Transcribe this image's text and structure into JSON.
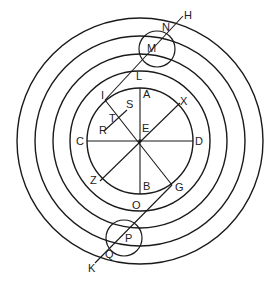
{
  "diagram": {
    "type": "geometry-concentric-circles",
    "colors": {
      "stroke": "#1a1a1a",
      "text": "#222222",
      "background": "#ffffff"
    },
    "center": {
      "x": 140,
      "y": 141
    },
    "rings": [
      {
        "name": "ring-1-inner",
        "r": 53
      },
      {
        "name": "ring-2",
        "r": 70
      },
      {
        "name": "ring-3",
        "r": 87
      },
      {
        "name": "ring-4",
        "r": 105
      },
      {
        "name": "ring-5-outer",
        "r": 123
      }
    ],
    "small_circles": [
      {
        "name": "circle-m",
        "cx": 157,
        "cy": 49,
        "r": 18
      },
      {
        "name": "circle-p",
        "cx": 124,
        "cy": 238,
        "r": 18
      }
    ],
    "segments": [
      {
        "name": "line-ab",
        "from": "A",
        "to": "B",
        "x1": 140,
        "y1": 88,
        "x2": 140,
        "y2": 194
      },
      {
        "name": "line-cd",
        "from": "C",
        "to": "D",
        "x1": 87,
        "y1": 141,
        "x2": 193,
        "y2": 141
      },
      {
        "name": "line-xz",
        "from": "X",
        "to": "Z",
        "x1": 180,
        "y1": 103,
        "x2": 100,
        "y2": 181
      },
      {
        "name": "line-ig",
        "from": "I",
        "to": "G",
        "x1": 105,
        "y1": 100,
        "x2": 172,
        "y2": 185
      },
      {
        "name": "line-rs",
        "from": "R",
        "to": "S",
        "x1": 104,
        "y1": 131,
        "x2": 127,
        "y2": 110
      },
      {
        "name": "line-lh",
        "from": "L",
        "to": "H",
        "x1": 105,
        "y1": 100,
        "x2": 183,
        "y2": 16
      },
      {
        "name": "line-gk",
        "from": "G",
        "to": "K",
        "x1": 172,
        "y1": 185,
        "x2": 95,
        "y2": 263
      }
    ],
    "labels": [
      {
        "text": "H",
        "x": 184,
        "y": 19
      },
      {
        "text": "N",
        "x": 162,
        "y": 31
      },
      {
        "text": "M",
        "x": 147,
        "y": 52
      },
      {
        "text": "L",
        "x": 136,
        "y": 80
      },
      {
        "text": "I",
        "x": 101,
        "y": 99
      },
      {
        "text": "S",
        "x": 126,
        "y": 108
      },
      {
        "text": "A",
        "x": 143,
        "y": 98
      },
      {
        "text": "X",
        "x": 180,
        "y": 105
      },
      {
        "text": "T",
        "x": 109,
        "y": 122
      },
      {
        "text": "R",
        "x": 99,
        "y": 134
      },
      {
        "text": "E",
        "x": 142,
        "y": 132
      },
      {
        "text": "C",
        "x": 76,
        "y": 145
      },
      {
        "text": "D",
        "x": 195,
        "y": 145
      },
      {
        "text": "Z",
        "x": 90,
        "y": 184
      },
      {
        "text": "B",
        "x": 143,
        "y": 190
      },
      {
        "text": "G",
        "x": 175,
        "y": 191
      },
      {
        "text": "O",
        "x": 132,
        "y": 209
      },
      {
        "text": "P",
        "x": 125,
        "y": 242
      },
      {
        "text": "Q",
        "x": 105,
        "y": 258
      },
      {
        "text": "K",
        "x": 88,
        "y": 272
      }
    ]
  }
}
